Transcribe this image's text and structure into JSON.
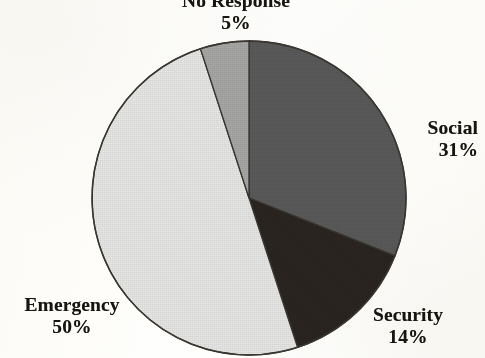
{
  "figure": {
    "background_color": "#fdfdfb",
    "text_color": "#17150f",
    "outline_color": "#3b3731"
  },
  "chart_data": {
    "type": "pie",
    "title": "",
    "subtitle": "",
    "xlabel": "",
    "ylabel": "",
    "grid": false,
    "legend_position": "none",
    "label_format": "name-above-percent",
    "start_angle_deg": 0,
    "direction": "clockwise",
    "center": {
      "x": 249,
      "y": 198
    },
    "radius": 157,
    "categories": [
      "Social",
      "Security",
      "Emergency",
      "No Response"
    ],
    "values": [
      31,
      14,
      50,
      5
    ],
    "units": "percent",
    "total": 100,
    "slices": [
      {
        "label": "Social",
        "value": 31,
        "percent_text": "31%",
        "color": "#5a5a5a",
        "start_angle_deg": 0,
        "end_angle_deg": 111.6,
        "label_position": "right"
      },
      {
        "label": "Security",
        "value": 14,
        "percent_text": "14%",
        "color": "#2a2520",
        "start_angle_deg": 111.6,
        "end_angle_deg": 162.0,
        "label_position": "bottom-right"
      },
      {
        "label": "Emergency",
        "value": 50,
        "percent_text": "50%",
        "color": "#e8e8e6",
        "start_angle_deg": 162.0,
        "end_angle_deg": 342.0,
        "label_position": "bottom-left"
      },
      {
        "label": "No Response",
        "value": 5,
        "percent_text": "5%",
        "color": "#a8a8a6",
        "start_angle_deg": 342.0,
        "end_angle_deg": 360.0,
        "label_position": "top"
      }
    ]
  },
  "labels": {
    "no_response": {
      "name": "No Response",
      "percent": "5%"
    },
    "social": {
      "name": "Social",
      "percent": "31%"
    },
    "security": {
      "name": "Security",
      "percent": "14%"
    },
    "emergency": {
      "name": "Emergency",
      "percent": "50%"
    }
  }
}
